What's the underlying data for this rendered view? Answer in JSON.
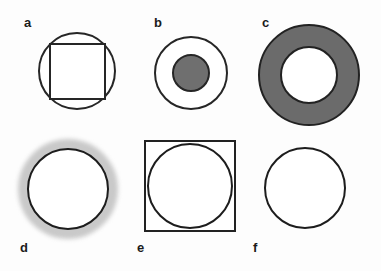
{
  "figure": {
    "background_color": "#fdfdfd",
    "stroke_color": "#222222",
    "fill_white": "#ffffff",
    "gray_mid": "#6b6b6b",
    "gray_light": "#c9c9c9",
    "rows": 2,
    "columns": 3,
    "panels": [
      {
        "id": "a",
        "label": "a",
        "description": "circle with inscribed square",
        "shapes": [
          {
            "name": "outer-circle",
            "type": "circle",
            "fill": "#ffffff",
            "stroke": "#262626"
          },
          {
            "name": "inscribed-square",
            "type": "square",
            "fill": "#ffffff",
            "stroke": "#262626"
          }
        ]
      },
      {
        "id": "b",
        "label": "b",
        "description": "outlined circle containing smaller gray filled circle",
        "shapes": [
          {
            "name": "outer-circle",
            "type": "circle",
            "fill": "#ffffff",
            "stroke": "#262626"
          },
          {
            "name": "inner-disc",
            "type": "circle",
            "fill": "#6f6f6f",
            "stroke": "#262626"
          }
        ]
      },
      {
        "id": "c",
        "label": "c",
        "description": "thick gray annulus with white center",
        "shapes": [
          {
            "name": "outer-circle",
            "type": "circle",
            "fill": "#6b6b6b",
            "stroke": "#222222"
          },
          {
            "name": "inner-circle",
            "type": "circle",
            "fill": "#ffffff",
            "stroke": "#222222"
          }
        ]
      },
      {
        "id": "d",
        "label": "d",
        "description": "outlined white circle surrounded by soft light gray halo",
        "shapes": [
          {
            "name": "halo",
            "type": "circle",
            "fill": "#c9c9c9",
            "stroke": "none"
          },
          {
            "name": "circle",
            "type": "circle",
            "fill": "#ffffff",
            "stroke": "#1d1d1d"
          }
        ]
      },
      {
        "id": "e",
        "label": "e",
        "description": "square with inscribed circle",
        "shapes": [
          {
            "name": "outer-square",
            "type": "square",
            "fill": "#ffffff",
            "stroke": "#222222"
          },
          {
            "name": "inscribed-circle",
            "type": "circle",
            "fill": "#ffffff",
            "stroke": "#1d1d1d"
          }
        ]
      },
      {
        "id": "f",
        "label": "f",
        "description": "plain outlined white circle",
        "shapes": [
          {
            "name": "circle",
            "type": "circle",
            "fill": "#ffffff",
            "stroke": "#1d1d1d"
          }
        ]
      }
    ]
  }
}
